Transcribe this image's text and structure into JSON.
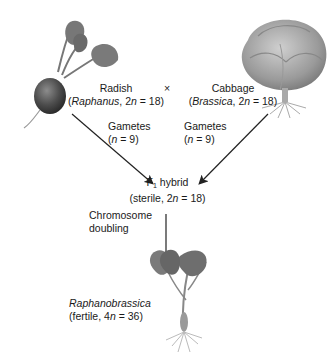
{
  "parents": {
    "radish": {
      "common_name": "Radish",
      "genus": "Raphanus",
      "ploidy_prefix": "2",
      "ploidy_var": "n",
      "chromosome_count": "= 18"
    },
    "cross_symbol": "×",
    "cabbage": {
      "common_name": "Cabbage",
      "genus": "Brassica",
      "ploidy_prefix": "2",
      "ploidy_var": "n",
      "chromosome_count": "= 18"
    }
  },
  "gametes": {
    "left": {
      "label": "Gametes",
      "ploidy_var": "n",
      "count": "= 9"
    },
    "right": {
      "label": "Gametes",
      "ploidy_var": "n",
      "count": "= 9"
    }
  },
  "hybrid": {
    "label_prefix": "F",
    "label_sub": "1",
    "label_suffix": "hybrid",
    "status": "sterile",
    "ploidy_prefix": "2",
    "ploidy_var": "n",
    "chromosome_count": "= 18"
  },
  "process": {
    "line1": "Chromosome",
    "line2": "doubling"
  },
  "result": {
    "name": "Raphanobrassica",
    "status": "fertile",
    "ploidy_prefix": "4",
    "ploidy_var": "n",
    "chromosome_count": "= 36"
  },
  "colors": {
    "text": "#1a1a1a",
    "arrow": "#222222",
    "plant_dark": "#555555",
    "plant_mid": "#8a8a8a",
    "plant_light": "#bdbdbd"
  },
  "icons": [
    "radish-illustration",
    "cabbage-illustration",
    "raphanobrassica-illustration",
    "arrow-icon"
  ]
}
